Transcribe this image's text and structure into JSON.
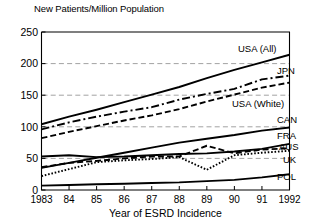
{
  "chart_data": {
    "type": "line",
    "title": "",
    "ylabel": "New Patients/Million Population",
    "xlabel": "Year of ESRD Incidence",
    "x": [
      1983,
      1984,
      1985,
      1986,
      1987,
      1988,
      1989,
      1990,
      1991,
      1992
    ],
    "xtick_labels": [
      "1983",
      "84",
      "85",
      "86",
      "87",
      "88",
      "89",
      "90",
      "91",
      "1992"
    ],
    "ytick_labels": [
      "0",
      "50",
      "100",
      "150",
      "200",
      "250"
    ],
    "ytick_values": [
      0,
      50,
      100,
      150,
      200,
      250
    ],
    "ylim": [
      0,
      250
    ],
    "xlim": [
      1983,
      1992
    ],
    "grid": "horizontal-dashed-at-50-100-150-200",
    "legend_position": "right-inline-labels",
    "series": [
      {
        "name": "USA (All)",
        "label": "USA (All)",
        "style": "solid",
        "values": [
          104,
          116,
          127,
          139,
          151,
          163,
          177,
          190,
          202,
          214
        ]
      },
      {
        "name": "JPN",
        "label": "JPN",
        "style": "dash-dot",
        "values": [
          96,
          107,
          116,
          124,
          131,
          143,
          152,
          160,
          175,
          181
        ]
      },
      {
        "name": "USA (White)",
        "label": "USA (White)",
        "style": "dashed",
        "values": [
          82,
          92,
          101,
          110,
          118,
          128,
          140,
          151,
          162,
          170
        ]
      },
      {
        "name": "CAN",
        "label": "CAN",
        "style": "solid",
        "values": [
          35,
          43,
          51,
          59,
          67,
          75,
          81,
          87,
          94,
          99
        ]
      },
      {
        "name": "FRA",
        "label": "FRA",
        "style": "solid",
        "values": [
          53,
          55,
          52,
          53,
          55,
          57,
          58,
          61,
          65,
          73
        ]
      },
      {
        "name": "AUS",
        "label": "AUS",
        "style": "dashed",
        "values": [
          36,
          43,
          46,
          50,
          53,
          53,
          70,
          58,
          64,
          66
        ]
      },
      {
        "name": "UK",
        "label": "UK",
        "style": "dotted",
        "values": [
          22,
          33,
          44,
          47,
          49,
          52,
          32,
          55,
          59,
          62
        ]
      },
      {
        "name": "POL",
        "label": "POL",
        "style": "solid",
        "values": [
          7,
          8,
          9,
          10,
          11,
          12,
          14,
          16,
          20,
          25
        ]
      }
    ],
    "annotations": []
  },
  "labels": {
    "y_axis_title": "New Patients/Million Population",
    "x_axis_title": "Year of ESRD Incidence"
  }
}
